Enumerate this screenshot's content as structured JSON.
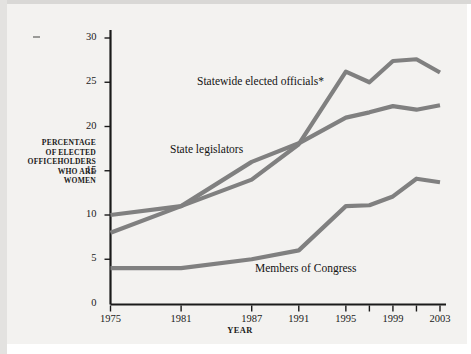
{
  "chart_data": {
    "type": "line",
    "title": "",
    "xlabel": "YEAR",
    "ylabel": "PERCENTAGE OF ELECTED OFFICEHOLDERS WHO ARE WOMEN",
    "x": [
      1975,
      1981,
      1987,
      1991,
      1995,
      1997,
      1999,
      2001,
      2003
    ],
    "xtick_labels": [
      "1975",
      "1981",
      "1987",
      "1991",
      "1995",
      "1999",
      "2003"
    ],
    "xtick_values": [
      1975,
      1981,
      1987,
      1991,
      1995,
      1999,
      2003
    ],
    "xminor_tick_values": [
      1997,
      2001
    ],
    "ytick_labels": [
      "0",
      "5",
      "10",
      "15",
      "20",
      "25",
      "30"
    ],
    "ytick_values": [
      0,
      5,
      10,
      15,
      20,
      25,
      30
    ],
    "ylim": [
      0,
      30
    ],
    "xlim": [
      1975,
      2003
    ],
    "grid": false,
    "legend": "inline-annotations",
    "series": [
      {
        "name": "Statewide elected officials*",
        "color": "#808080",
        "values": [
          8.0,
          11.0,
          14.0,
          18.0,
          26.2,
          25.0,
          27.4,
          27.6,
          26.1
        ]
      },
      {
        "name": "State legislators",
        "color": "#808080",
        "values": [
          10.0,
          11.0,
          16.0,
          18.1,
          21.0,
          21.6,
          22.3,
          21.9,
          22.4
        ]
      },
      {
        "name": "Members of Congress",
        "color": "#808080",
        "values": [
          4.0,
          4.0,
          5.0,
          6.0,
          11.0,
          11.1,
          12.1,
          14.1,
          13.7
        ]
      }
    ]
  },
  "annotations": {
    "statewide": "Statewide elected officials*",
    "legislators": "State legislators",
    "congress": "Members of Congress"
  },
  "axis": {
    "y_title_lines": [
      "PERCENTAGE",
      "OF ELECTED",
      "OFFICEHOLDERS",
      "WHO ARE",
      "WOMEN"
    ],
    "y_title": "PERCENTAGE OF ELECTED OFFICEHOLDERS WHO ARE WOMEN",
    "x_title": "YEAR"
  },
  "footnote": {
    "text": ""
  },
  "colors": {
    "line": "#808080",
    "axis": "#1a1a1a",
    "text": "#1a1a1a",
    "background": "#f3f2f0"
  }
}
